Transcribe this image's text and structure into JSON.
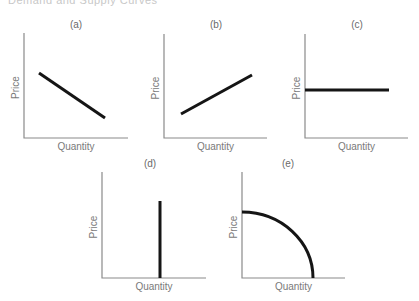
{
  "chart_data": {
    "type": "line",
    "panels": [
      {
        "id": "a",
        "label": "(a)",
        "xlabel": "Quantity",
        "ylabel": "Price",
        "description": "downward-sloping straight line",
        "axis": {
          "x0": 24,
          "y0": 138,
          "xmax": 128,
          "ytop": 33
        },
        "curve": {
          "kind": "line",
          "points": [
            [
              39,
              73
            ],
            [
              105,
              118
            ]
          ]
        },
        "label_pos": [
          76,
          28
        ]
      },
      {
        "id": "b",
        "label": "(b)",
        "xlabel": "Quantity",
        "ylabel": "Price",
        "description": "upward-sloping straight line",
        "axis": {
          "x0": 164,
          "y0": 138,
          "xmax": 267,
          "ytop": 34
        },
        "curve": {
          "kind": "line",
          "points": [
            [
              181,
              114
            ],
            [
              252,
              75
            ]
          ]
        },
        "label_pos": [
          216,
          28
        ]
      },
      {
        "id": "c",
        "label": "(c)",
        "xlabel": "Quantity",
        "ylabel": "Price",
        "description": "horizontal line (perfectly elastic)",
        "axis": {
          "x0": 305,
          "y0": 138,
          "xmax": 408,
          "ytop": 34
        },
        "curve": {
          "kind": "line",
          "points": [
            [
              305,
              90
            ],
            [
              389,
              90
            ]
          ]
        },
        "label_pos": [
          357,
          28
        ]
      },
      {
        "id": "d",
        "label": "(d)",
        "xlabel": "Quantity",
        "ylabel": "Price",
        "description": "vertical line (perfectly inelastic)",
        "axis": {
          "x0": 102,
          "y0": 278,
          "xmax": 206,
          "ytop": 172
        },
        "curve": {
          "kind": "line",
          "points": [
            [
              160,
              201
            ],
            [
              160,
              278
            ]
          ]
        },
        "label_pos": [
          150,
          167
        ]
      },
      {
        "id": "e",
        "label": "(e)",
        "xlabel": "Quantity",
        "ylabel": "Price",
        "description": "concave downward curve from price axis to quantity axis",
        "axis": {
          "x0": 242,
          "y0": 278,
          "xmax": 345,
          "ytop": 172
        },
        "curve": {
          "kind": "arc",
          "points": [
            [
              242,
              212
            ],
            [
              313,
              278
            ]
          ]
        },
        "label_pos": [
          288,
          167
        ]
      }
    ],
    "grid": false,
    "legend": null
  },
  "header_fragment": "Demand and Supply Curves"
}
